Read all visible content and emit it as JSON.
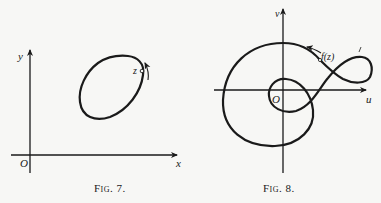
{
  "figures": [
    {
      "id": "fig7",
      "caption": "Fig. 7.",
      "axes": {
        "x_label": "x",
        "y_label": "y",
        "origin_label": "O"
      },
      "curve": {
        "type": "closed-loop",
        "point_label": "z",
        "direction": "counterclockwise"
      }
    },
    {
      "id": "fig8",
      "caption": "Fig. 8.",
      "axes": {
        "x_label": "u",
        "y_label": "v",
        "origin_label": "O"
      },
      "curve": {
        "type": "image-curve-with-self-intersections",
        "point_label": "f(z)",
        "direction": "counterclockwise",
        "side_mark": "/"
      }
    }
  ],
  "colors": {
    "ink": "#1a1a1a",
    "paper": "#f7f7f5"
  }
}
